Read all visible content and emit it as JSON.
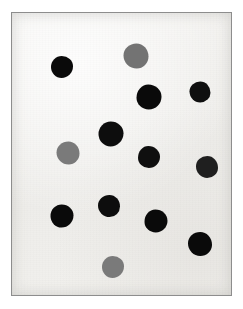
{
  "image": {
    "kind": "photograph",
    "subject": "spot-blot-plate",
    "description": "Scanned white card showing thirteen round dark ink spots arranged in a scattered grid",
    "width": 243,
    "height": 309,
    "outer_background_color": "#ffffff",
    "plate_background_color": "#f4f3f1",
    "plate_border_color": "#8d8d8d",
    "caption": ""
  },
  "plate": {
    "left": 11,
    "top": 12,
    "width": 221,
    "height": 284,
    "spot_count": 13,
    "dark_spot_count": 10,
    "grey_spot_count": 3
  },
  "legend": {
    "dark_color": "#0d0d0d",
    "mid_color": "#3a3a3a",
    "grey_color": "#6f6f6f",
    "dark_label": "strong",
    "grey_label": "weak"
  },
  "chart_data": {
    "type": "scatter",
    "title": "",
    "xlabel": "",
    "ylabel": "",
    "xlim": [
      0,
      221
    ],
    "ylim": [
      0,
      284
    ],
    "grid": false,
    "legend_position": "none",
    "series": [
      {
        "name": "strong",
        "color": "#0d0d0d",
        "points": [
          {
            "id": "spot-1",
            "x": 39,
            "y": 43,
            "r": 11.0,
            "intensity": 0.96
          },
          {
            "id": "spot-3",
            "x": 124,
            "y": 71,
            "r": 12.5,
            "intensity": 0.96
          },
          {
            "id": "spot-4",
            "x": 177,
            "y": 68,
            "r": 10.5,
            "intensity": 0.94
          },
          {
            "id": "spot-5",
            "x": 86,
            "y": 108,
            "r": 12.5,
            "intensity": 0.95
          },
          {
            "id": "spot-7",
            "x": 126,
            "y": 133,
            "r": 11.0,
            "intensity": 0.94
          },
          {
            "id": "spot-8",
            "x": 184,
            "y": 143,
            "r": 11.0,
            "intensity": 0.88
          },
          {
            "id": "spot-9",
            "x": 38,
            "y": 191,
            "r": 11.5,
            "intensity": 0.96
          },
          {
            "id": "spot-10",
            "x": 86,
            "y": 182,
            "r": 11.0,
            "intensity": 0.95
          },
          {
            "id": "spot-11",
            "x": 132,
            "y": 196,
            "r": 11.5,
            "intensity": 0.96
          },
          {
            "id": "spot-12",
            "x": 176,
            "y": 219,
            "r": 12.0,
            "intensity": 0.96
          }
        ]
      },
      {
        "name": "weak",
        "color": "#6f6f6f",
        "points": [
          {
            "id": "spot-2",
            "x": 111,
            "y": 30,
            "r": 12.5,
            "intensity": 0.55
          },
          {
            "id": "spot-6",
            "x": 44,
            "y": 128,
            "r": 11.5,
            "intensity": 0.52
          },
          {
            "id": "spot-13",
            "x": 90,
            "y": 243,
            "r": 11.0,
            "intensity": 0.52
          }
        ]
      }
    ]
  }
}
